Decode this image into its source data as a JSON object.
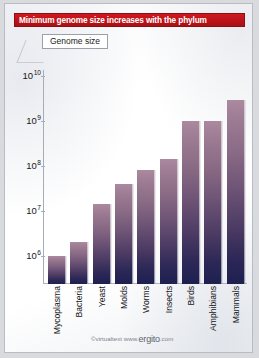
{
  "title": "Minimum genome size increases with the phylum",
  "legend": {
    "label": "Genome size"
  },
  "footer": {
    "copyright": "©virtualtext  www.",
    "brand": "ergito",
    "tld": ".com"
  },
  "colors": {
    "banner_red": "#bb1419",
    "bar_top": "#ab8aa0",
    "bar_bottom": "#1e2050",
    "card_background": "#fdfdfd",
    "page_background": "#d8dade",
    "axis": "#a8acb4",
    "text": "#15161a"
  },
  "axis": {
    "ticks": [
      {
        "mantissa": "10",
        "exponent": "10",
        "value": 10000000000.0
      },
      {
        "mantissa": "10",
        "exponent": "9",
        "value": 1000000000.0
      },
      {
        "mantissa": "10",
        "exponent": "8",
        "value": 100000000.0
      },
      {
        "mantissa": "10",
        "exponent": "7",
        "value": 10000000.0
      },
      {
        "mantissa": "10",
        "exponent": "6",
        "value": 1000000.0
      }
    ]
  },
  "chart_data": {
    "type": "bar",
    "title": "Minimum genome size increases with the phylum",
    "xlabel": "",
    "ylabel": "Genome size",
    "scale": "log10",
    "ylim": [
      1000000,
      10000000000
    ],
    "grid": false,
    "legend": [
      "Genome size"
    ],
    "legend_position": "top-left",
    "categories": [
      "Mycoplasma",
      "Bacteria",
      "Yeast",
      "Molds",
      "Worms",
      "Insects",
      "Birds",
      "Amphibians",
      "Mammals"
    ],
    "values": [
      1000000,
      2000000,
      14000000,
      40000000,
      80000000,
      140000000,
      1000000000,
      1000000000,
      3000000000
    ],
    "value_labels": [
      "1×10⁶",
      "2×10⁶",
      "1.4×10⁷",
      "4×10⁷",
      "8×10⁷",
      "1.4×10⁸",
      "1×10⁹",
      "1×10⁹",
      "3×10⁹"
    ]
  }
}
